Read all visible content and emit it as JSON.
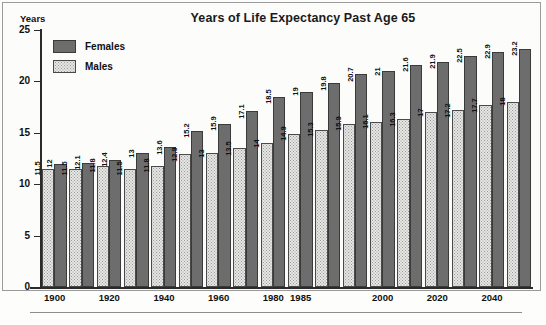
{
  "chart_data": {
    "type": "bar",
    "title": "Years of Life Expectancy Past Age 65",
    "xlabel": "",
    "ylabel": "Years",
    "ylim": [
      0,
      25
    ],
    "yticks": [
      0,
      5,
      10,
      15,
      20,
      25
    ],
    "grid": false,
    "legend_position": "top-left",
    "categories": [
      "1900",
      "1910",
      "1920",
      "1930",
      "1940",
      "1950",
      "1960",
      "1970",
      "1980",
      "1985",
      "1990",
      "1995",
      "2000",
      "2010",
      "2020",
      "2030",
      "2040",
      "2050"
    ],
    "xtick_labels": [
      "1900",
      "1920",
      "1940",
      "1960",
      "1980",
      "1985",
      "2000",
      "2020",
      "2040"
    ],
    "xtick_categories": [
      "1900",
      "1920",
      "1940",
      "1960",
      "1980",
      "1985",
      "2000",
      "2020",
      "2040"
    ],
    "series": [
      {
        "name": "Males",
        "color": "#e6e6e4",
        "values": [
          11.5,
          11.5,
          11.8,
          11.5,
          11.8,
          12.9,
          13,
          13.5,
          14,
          14.9,
          15.3,
          15.9,
          16.1,
          16.3,
          17,
          17.2,
          17.7,
          18
        ]
      },
      {
        "name": "Females",
        "color": "#6d6d6d",
        "values": [
          12,
          12.1,
          12.4,
          13,
          13.6,
          15.2,
          15.9,
          17.1,
          18.5,
          19,
          19.8,
          20.7,
          21,
          21.6,
          21.9,
          22.5,
          22.9,
          23.2
        ]
      }
    ]
  },
  "legend": {
    "items": [
      {
        "label": "Females",
        "key": "female"
      },
      {
        "label": "Males",
        "key": "male"
      }
    ]
  }
}
